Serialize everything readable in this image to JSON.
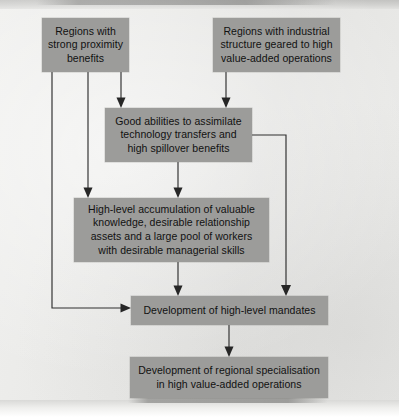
{
  "diagram": {
    "type": "flowchart",
    "title_visible": false,
    "colors": {
      "page_background": "#e9e9e7",
      "node_fill": "#9c9c9a",
      "node_text": "#111111",
      "connector": "#2e2e2e"
    },
    "nodes": [
      {
        "id": "regions-proximity",
        "label": "Regions with strong proximity benefits",
        "lines": [
          "Regions with",
          "strong proximity",
          "benefits"
        ]
      },
      {
        "id": "regions-industrial",
        "label": "Regions with industrial structure geared to high value-added operations",
        "lines": [
          "Regions with industrial",
          "structure geared to high",
          "value-added operations"
        ]
      },
      {
        "id": "assimilate",
        "label": "Good abilities to assimilate technology transfers and high spillover benefits",
        "lines": [
          "Good abilities to assimilate",
          "technology transfers and",
          "high spillover benefits"
        ]
      },
      {
        "id": "accumulation",
        "label": "High-level accumulation of valuable knowledge, desirable relationship assets and a large pool of workers with desirable managerial skills",
        "lines": [
          "High-level accumulation of valuable",
          "knowledge, desirable relationship",
          "assets and a large pool of workers",
          "with desirable managerial skills"
        ]
      },
      {
        "id": "mandates",
        "label": "Development of high-level mandates",
        "lines": [
          "Development of high-level mandates"
        ]
      },
      {
        "id": "specialisation",
        "label": "Development of regional specialisation in high value-added operations",
        "lines": [
          "Development of regional specialisation",
          "in high value-added operations"
        ]
      }
    ],
    "edges": [
      {
        "id": "edge-proximity-to-assimilate",
        "from": "regions-proximity",
        "to": "assimilate",
        "arrow": "down"
      },
      {
        "id": "edge-proximity-to-accumulation",
        "from": "regions-proximity",
        "to": "accumulation",
        "arrow": "down"
      },
      {
        "id": "edge-proximity-to-mandates",
        "from": "regions-proximity",
        "to": "mandates",
        "arrow": "right"
      },
      {
        "id": "edge-industrial-to-assimilate",
        "from": "regions-industrial",
        "to": "assimilate",
        "arrow": "down"
      },
      {
        "id": "edge-assimilate-to-accumulation",
        "from": "assimilate",
        "to": "accumulation",
        "arrow": "down"
      },
      {
        "id": "edge-assimilate-to-mandates",
        "from": "assimilate",
        "to": "mandates",
        "arrow": "down"
      },
      {
        "id": "edge-accumulation-to-mandates",
        "from": "accumulation",
        "to": "mandates",
        "arrow": "down"
      },
      {
        "id": "edge-mandates-to-specialisation",
        "from": "mandates",
        "to": "specialisation",
        "arrow": "down"
      }
    ]
  }
}
